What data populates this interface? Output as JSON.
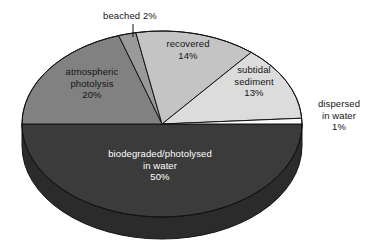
{
  "chart_data": {
    "type": "pie",
    "title": "",
    "subtitle": "",
    "xlabel": "",
    "ylabel": "",
    "legend_position": "none",
    "grid": false,
    "style": "3d-exploded-none",
    "units": "percent",
    "total": 100,
    "categories": [
      "beached",
      "recovered",
      "subtidal sediment",
      "dispersed in water",
      "biodegraded/photolysed in water",
      "atmospheric photolysis"
    ],
    "values": [
      2,
      14,
      13,
      1,
      50,
      20
    ],
    "labels": [
      "beached 2%",
      "recovered 14%",
      "subtidal sediment 13%",
      "dispersed in water 1%",
      "biodegraded/photolysed in water 50%",
      "atmospheric photolysis 20%"
    ],
    "colors": [
      "#9a9a9a",
      "#c4c4c4",
      "#dcdcdc",
      "#fbfbfb",
      "#3b3b3b",
      "#818181"
    ],
    "slices": [
      {
        "name": "beached",
        "value": 2,
        "value_label": "2%",
        "color": "#9a9a9a",
        "label_lines": [
          "beached 2%"
        ],
        "label_placement": "outside-top",
        "has_leader_line": true
      },
      {
        "name": "recovered",
        "value": 14,
        "value_label": "14%",
        "color": "#c4c4c4",
        "label_lines": [
          "recovered",
          "14%"
        ],
        "label_placement": "inside"
      },
      {
        "name": "subtidal sediment",
        "value": 13,
        "value_label": "13%",
        "color": "#dcdcdc",
        "label_lines": [
          "subtidal",
          "sediment",
          "13%"
        ],
        "label_placement": "inside"
      },
      {
        "name": "dispersed in water",
        "value": 1,
        "value_label": "1%",
        "color": "#fbfbfb",
        "label_lines": [
          "dispersed",
          "in water",
          "1%"
        ],
        "label_placement": "outside-right"
      },
      {
        "name": "biodegraded/photolysed in water",
        "value": 50,
        "value_label": "50%",
        "color": "#3b3b3b",
        "label_lines": [
          "biodegraded/photolysed",
          "in water",
          "50%"
        ],
        "label_placement": "inside-dark"
      },
      {
        "name": "atmospheric photolysis",
        "value": 20,
        "value_label": "20%",
        "color": "#818181",
        "label_lines": [
          "atmospheric",
          "photolysis",
          "20%"
        ],
        "label_placement": "inside"
      }
    ]
  },
  "labels": {
    "beached": {
      "l1": "beached 2%"
    },
    "recovered": {
      "l1": "recovered",
      "l2": "14%"
    },
    "subtidal": {
      "l1": "subtidal",
      "l2": "sediment",
      "l3": "13%"
    },
    "dispersed": {
      "l1": "dispersed",
      "l2": "in water",
      "l3": "1%"
    },
    "atmospheric": {
      "l1": "atmospheric",
      "l2": "photolysis",
      "l3": "20%"
    },
    "biodegraded": {
      "l1": "biodegraded/photolysed",
      "l2": "in water",
      "l3": "50%"
    }
  }
}
